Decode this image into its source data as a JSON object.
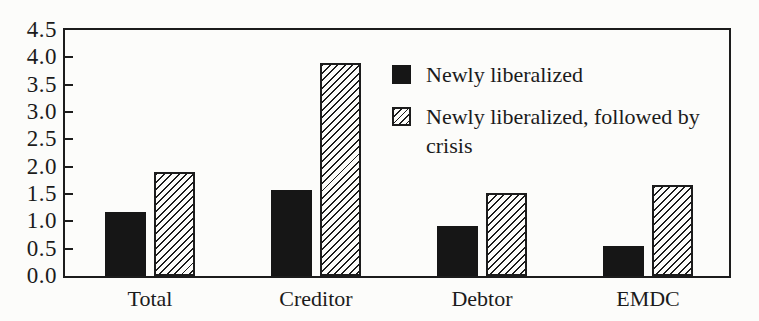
{
  "chart_data": {
    "type": "bar",
    "title": "",
    "xlabel": "",
    "ylabel": "",
    "categories": [
      "Total",
      "Creditor",
      "Debtor",
      "EMDC"
    ],
    "series": [
      {
        "name": "Newly liberalized",
        "style": "solid",
        "values": [
          1.18,
          1.58,
          0.92,
          0.55
        ]
      },
      {
        "name": "Newly liberalized, followed by crisis",
        "style": "hatched",
        "values": [
          1.9,
          3.9,
          1.52,
          1.67
        ]
      }
    ],
    "ylim": [
      0,
      4.5
    ],
    "ytick_step": 0.5,
    "ytick_labels": [
      "4.5",
      "4.0",
      "3.5",
      "3.0",
      "2.5",
      "2.0",
      "1.5",
      "1.0",
      "0.5",
      "0.0"
    ],
    "grid": false,
    "legend_position": "inside-top-right"
  },
  "legend": {
    "items": [
      {
        "label": "Newly liberalized",
        "swatch": "solid-black-square-icon"
      },
      {
        "label": "Newly liberalized, followed by crisis",
        "swatch": "hatched-square-icon"
      }
    ]
  },
  "colors": {
    "ink": "#1c1c1c",
    "bar_solid": "#161616",
    "background": "#fcfcfa"
  }
}
